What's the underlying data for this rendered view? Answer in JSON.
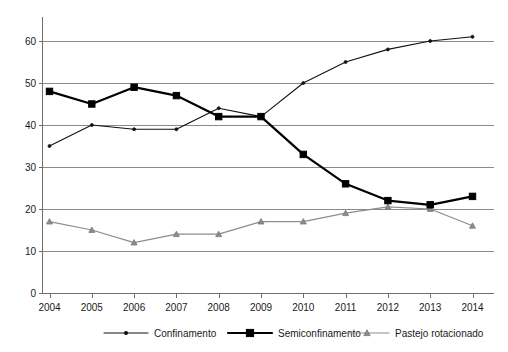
{
  "chart_data": {
    "type": "line",
    "title": "",
    "xlabel": "",
    "ylabel": "",
    "categories": [
      "2004",
      "2005",
      "2006",
      "2007",
      "2008",
      "2009",
      "2010",
      "2011",
      "2012",
      "2013",
      "2014"
    ],
    "ylim": [
      0,
      60
    ],
    "yticks": [
      0,
      10,
      20,
      30,
      40,
      50,
      60
    ],
    "ytick_labels": [
      "0",
      "10",
      "20",
      "30",
      "40",
      "50",
      "60"
    ],
    "grid": "horizontal",
    "legend_position": "bottom",
    "series": [
      {
        "name": "Confinamento",
        "marker": "dot",
        "color": "#111111",
        "values": [
          35,
          40,
          39,
          39,
          44,
          42,
          50,
          55,
          58,
          60,
          61
        ]
      },
      {
        "name": "Semiconfinamento",
        "marker": "square",
        "color": "#000000",
        "values": [
          48,
          45,
          49,
          47,
          42,
          42,
          33,
          26,
          22,
          21,
          23
        ]
      },
      {
        "name": "Pastejo rotacionado",
        "marker": "triangle",
        "color": "#8c8c8c",
        "values": [
          17,
          15,
          12,
          14,
          14,
          17,
          17,
          19,
          20.5,
          20,
          16
        ]
      }
    ]
  },
  "legend": {
    "items": [
      {
        "label": "Confinamento"
      },
      {
        "label": "Semiconfinamento"
      },
      {
        "label": "Pastejo rotacionado"
      }
    ]
  },
  "axis": {
    "y_labels": [
      "60",
      "50",
      "40",
      "30",
      "20",
      "10",
      "0"
    ],
    "x_labels": [
      "2004",
      "2005",
      "2006",
      "2007",
      "2008",
      "2009",
      "2010",
      "2011",
      "2012",
      "2013",
      "2014"
    ]
  }
}
